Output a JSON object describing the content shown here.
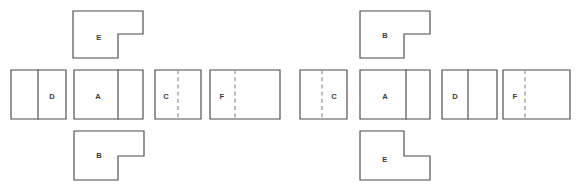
{
  "diagram": {
    "background_color": "#ffffff",
    "stroke_color": "#4a4a4a",
    "dashed_stroke_color": "#8c8c8c",
    "label_color": "#3a3a3a",
    "groups": [
      {
        "name": "left-arrangement",
        "shapes": [
          {
            "id": "left-e-top",
            "label": "E",
            "form": "l-shape",
            "notch_corner": "bottom-right",
            "x": 73,
            "y": 11,
            "width": 70,
            "height": 47,
            "notch_x": 118,
            "notch_y": 34,
            "label_x": 99,
            "label_y": 38,
            "divider": null
          },
          {
            "id": "left-d",
            "label": "D",
            "form": "rectangle",
            "x": 11,
            "y": 70,
            "width": 55,
            "height": 49,
            "label_x": 52,
            "label_y": 97,
            "divider": {
              "type": "solid",
              "x": 38
            }
          },
          {
            "id": "left-a",
            "label": "A",
            "form": "rectangle",
            "x": 74,
            "y": 70,
            "width": 69,
            "height": 49,
            "label_x": 98,
            "label_y": 97,
            "divider": {
              "type": "solid",
              "x": 118
            }
          },
          {
            "id": "left-c",
            "label": "C",
            "form": "rectangle",
            "x": 155,
            "y": 70,
            "width": 46,
            "height": 49,
            "label_x": 166,
            "label_y": 97,
            "divider": {
              "type": "dashed",
              "x": 178
            }
          },
          {
            "id": "left-f",
            "label": "F",
            "form": "rectangle",
            "x": 210,
            "y": 70,
            "width": 70,
            "height": 49,
            "label_x": 222,
            "label_y": 97,
            "divider": {
              "type": "dashed",
              "x": 235
            }
          },
          {
            "id": "left-b-bottom",
            "label": "B",
            "form": "l-shape",
            "notch_corner": "bottom-right",
            "x": 74,
            "y": 131,
            "width": 70,
            "height": 49,
            "notch_x": 118,
            "notch_y": 156,
            "label_x": 99,
            "label_y": 156,
            "divider": null
          }
        ]
      },
      {
        "name": "right-arrangement",
        "shapes": [
          {
            "id": "right-b-top",
            "label": "B",
            "form": "l-shape",
            "notch_corner": "bottom-right",
            "x": 360,
            "y": 11,
            "width": 70,
            "height": 47,
            "notch_x": 404,
            "notch_y": 34,
            "label_x": 385,
            "label_y": 36,
            "divider": null
          },
          {
            "id": "right-c",
            "label": "C",
            "form": "rectangle",
            "x": 300,
            "y": 70,
            "width": 47,
            "height": 49,
            "label_x": 334,
            "label_y": 97,
            "divider": {
              "type": "dashed",
              "x": 322
            }
          },
          {
            "id": "right-a",
            "label": "A",
            "form": "rectangle",
            "x": 360,
            "y": 70,
            "width": 70,
            "height": 49,
            "label_x": 385,
            "label_y": 97,
            "divider": {
              "type": "solid",
              "x": 406
            }
          },
          {
            "id": "right-d",
            "label": "D",
            "form": "rectangle",
            "x": 442,
            "y": 70,
            "width": 55,
            "height": 49,
            "label_x": 455,
            "label_y": 97,
            "divider": {
              "type": "solid",
              "x": 468
            }
          },
          {
            "id": "right-f",
            "label": "F",
            "form": "rectangle",
            "x": 503,
            "y": 70,
            "width": 67,
            "height": 49,
            "label_x": 515,
            "label_y": 97,
            "divider": {
              "type": "dashed",
              "x": 525
            }
          },
          {
            "id": "right-e-bottom",
            "label": "E",
            "form": "l-shape",
            "notch_corner": "top-right",
            "x": 360,
            "y": 131,
            "width": 70,
            "height": 49,
            "notch_x": 404,
            "notch_y": 156,
            "label_x": 385,
            "label_y": 160,
            "divider": null
          }
        ]
      }
    ]
  }
}
